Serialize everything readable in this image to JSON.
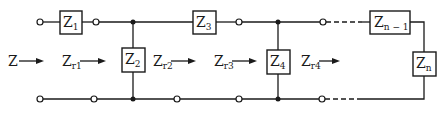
{
  "diagram": {
    "type": "ladder-network",
    "colors": {
      "line": "#1a1a1a",
      "background": "#ffffff"
    },
    "impedances": [
      {
        "id": "Z1",
        "base": "Z",
        "sub": "1",
        "role": "series"
      },
      {
        "id": "Z2",
        "base": "Z",
        "sub": "2",
        "role": "shunt"
      },
      {
        "id": "Z3",
        "base": "Z",
        "sub": "3",
        "role": "series"
      },
      {
        "id": "Z4",
        "base": "Z",
        "sub": "4",
        "role": "shunt"
      },
      {
        "id": "Zn-1",
        "base": "Z",
        "sub": "n − 1",
        "role": "series"
      },
      {
        "id": "Zn",
        "base": "Z",
        "sub": "n",
        "role": "shunt-terminal"
      }
    ],
    "impedance_labels": [
      {
        "base": "Z",
        "sub": ""
      },
      {
        "base": "Z",
        "sub": "r1"
      },
      {
        "base": "Z",
        "sub": "r2"
      },
      {
        "base": "Z",
        "sub": "r3"
      },
      {
        "base": "Z",
        "sub": "r4"
      }
    ]
  }
}
